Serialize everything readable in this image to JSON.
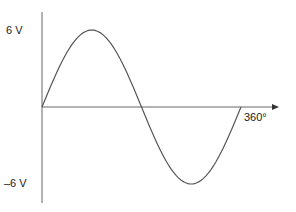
{
  "chart_data": {
    "type": "line",
    "title": "",
    "xlabel": "",
    "ylabel": "",
    "x_tick_labels": [
      "360°"
    ],
    "y_tick_labels": [
      "6 V",
      "–6 V"
    ],
    "ylim": [
      -6,
      6
    ],
    "xlim": [
      0,
      360
    ],
    "grid": false,
    "series": [
      {
        "name": "sine wave",
        "x": [
          0,
          45,
          90,
          135,
          180,
          225,
          270,
          315,
          360
        ],
        "values": [
          0,
          4.24,
          6,
          4.24,
          0,
          -4.24,
          -6,
          -4.24,
          0
        ]
      }
    ],
    "colors": {
      "line": "#555555",
      "axis": "#555555"
    }
  },
  "labels": {
    "y_max": "6 V",
    "y_min": "–6 V",
    "x_end": "360°"
  }
}
